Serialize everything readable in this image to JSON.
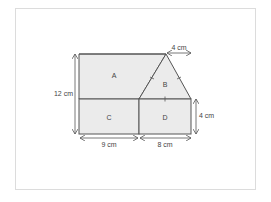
{
  "diagram": {
    "regions": [
      {
        "id": "A",
        "label": "A"
      },
      {
        "id": "B",
        "label": "B"
      },
      {
        "id": "C",
        "label": "C"
      },
      {
        "id": "D",
        "label": "D"
      }
    ],
    "dimensions": {
      "height_total": "12 cm",
      "triangle_offset": "4 cm",
      "right_height": "4 cm",
      "bottom_left": "9 cm",
      "bottom_right": "8 cm"
    },
    "colors": {
      "fill": "#ebebeb",
      "stroke": "#555555",
      "border": "#dcdcdc"
    }
  }
}
